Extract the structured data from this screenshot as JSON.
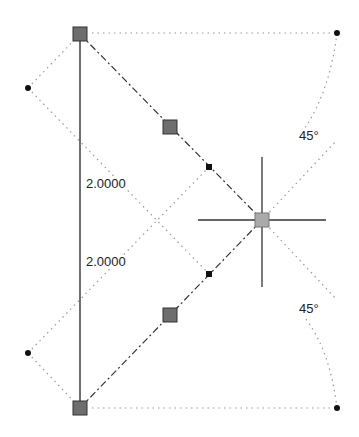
{
  "dimensions": {
    "left": "2.0000",
    "right": "2.0000"
  },
  "angles": {
    "top": "45°",
    "bottom": "45°"
  },
  "colors": {
    "grip": "#6e6e6e",
    "line": "#222222",
    "dotted": "#9a9a9a",
    "cursor": "#333333"
  }
}
